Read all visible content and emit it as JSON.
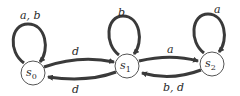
{
  "diagram": {
    "type": "state-machine",
    "states": [
      {
        "id": "s0",
        "name": "s",
        "sub": "0"
      },
      {
        "id": "s1",
        "name": "s",
        "sub": "1"
      },
      {
        "id": "s2",
        "name": "s",
        "sub": "2"
      }
    ],
    "transitions": [
      {
        "from": "s0",
        "to": "s0",
        "label": "a, b"
      },
      {
        "from": "s0",
        "to": "s1",
        "label": "d"
      },
      {
        "from": "s1",
        "to": "s0",
        "label": "d"
      },
      {
        "from": "s1",
        "to": "s1",
        "label": "b"
      },
      {
        "from": "s1",
        "to": "s2",
        "label": "a"
      },
      {
        "from": "s2",
        "to": "s1",
        "label": "b, d"
      },
      {
        "from": "s2",
        "to": "s2",
        "label": "a"
      }
    ],
    "colors": {
      "stroke": "#3a3a3a",
      "fill": "#ffffff",
      "text": "#2a2a2a"
    }
  }
}
